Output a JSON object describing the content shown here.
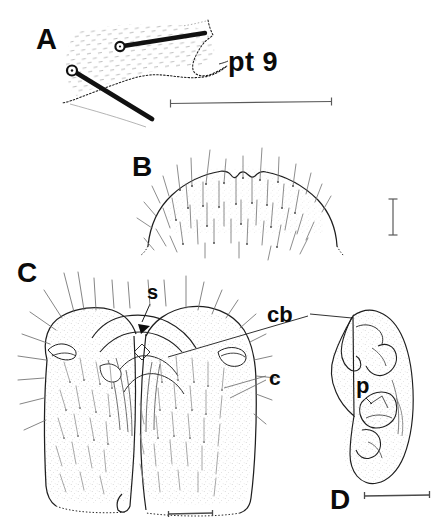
{
  "figure": {
    "type": "scientific-line-drawing-plate",
    "panel_count": 4,
    "background_color": "#ffffff",
    "ink_color": "#1a1a1a"
  },
  "panels": [
    {
      "id": "A",
      "label": "A",
      "subject": "abdominal tergite with two stout setae and pt 9 process",
      "callouts": [
        {
          "name": "pt9",
          "label": "pt 9"
        }
      ],
      "scalebar": {
        "orientation": "horizontal",
        "x1": 170,
        "x2": 332,
        "y": 103
      }
    },
    {
      "id": "B",
      "label": "B",
      "subject": "convex setose sclerite margin with median notch",
      "callouts": [],
      "scalebar": {
        "orientation": "vertical",
        "x": 393,
        "y1": 198,
        "y2": 235
      }
    },
    {
      "id": "C",
      "label": "C",
      "subject": "bilobed setose genital capsule, ventral view",
      "callouts": [
        {
          "name": "s",
          "label": "s"
        },
        {
          "name": "cb",
          "label": "cb"
        },
        {
          "name": "c",
          "label": "c"
        }
      ],
      "scalebar": {
        "orientation": "horizontal",
        "x1": 168,
        "x2": 213,
        "y": 514
      }
    },
    {
      "id": "D",
      "label": "D",
      "subject": "genital valve / paramere, lateral view",
      "callouts": [
        {
          "name": "p",
          "label": "p"
        }
      ],
      "scalebar": {
        "orientation": "horizontal",
        "x1": 364,
        "x2": 430,
        "y": 496
      }
    }
  ],
  "labels": {
    "panel_a": "A",
    "panel_b": "B",
    "panel_c": "C",
    "panel_d": "D",
    "pt9": "pt 9",
    "s": "s",
    "cb": "cb",
    "c": "c",
    "p": "p"
  },
  "caption": {
    "text": ""
  }
}
